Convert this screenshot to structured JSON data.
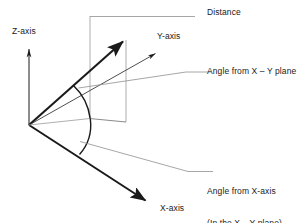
{
  "figure": {
    "background_color": "#ffffff",
    "line_color_primary": "#1a1a1a",
    "line_color_leader": "#8a8a8a"
  },
  "axes": [
    {
      "id": "z",
      "label": "Z-axis",
      "direction": "up",
      "style": "thin-arrow"
    },
    {
      "id": "y",
      "label": "Y-axis",
      "direction": "up-right",
      "style": "thin-arrow"
    },
    {
      "id": "x",
      "label": "X-axis",
      "direction": "down-right",
      "style": "thick-arrow"
    }
  ],
  "callouts": [
    {
      "id": "distance",
      "line1": "Distance",
      "line2": ""
    },
    {
      "id": "angle-from-xy-plane",
      "line1": "Angle from X – Y plane",
      "line2": ""
    },
    {
      "id": "angle-from-x-axis",
      "line1": "Angle from X-axis",
      "line2": "(In the X – Y plane)"
    }
  ],
  "labels": {
    "z_axis": "Z-axis",
    "y_axis": "Y-axis",
    "x_axis": "X-axis",
    "distance": "Distance",
    "angle_xy_plane": "Angle from X – Y plane",
    "angle_x_axis_line1": "Angle from X-axis",
    "angle_x_axis_line2": "(In the X – Y plane)"
  }
}
